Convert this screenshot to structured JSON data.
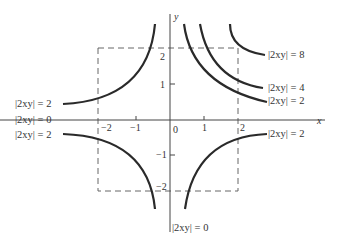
{
  "diagram": {
    "axes": {
      "x_label": "x",
      "y_label": "y",
      "origin_label": "0",
      "x_ticks": [
        "−2",
        "−1",
        "1",
        "2"
      ],
      "y_ticks": [
        "2",
        "1",
        "−1",
        "−2"
      ]
    },
    "labels": {
      "right_8": "|2xy| = 8",
      "right_4": "|2xy| = 4",
      "right_2_upper": "|2xy| = 2",
      "right_2_lower": "|2xy| = 2",
      "left_2_upper": "|2xy| = 2",
      "left_0": "|2xy| = 0",
      "left_2_lower": "|2xy| = 2",
      "bottom_0": "|2xy| = 0"
    },
    "box": "dashed square from (−2,−2) to (2,2)",
    "colors": {
      "curve": "#2a2a2a",
      "axis": "#444444",
      "dash": "#666666",
      "text": "#333333"
    }
  }
}
